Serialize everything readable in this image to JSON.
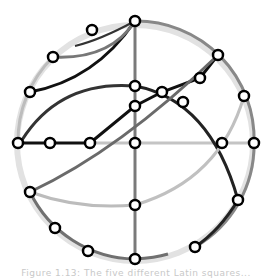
{
  "caption": "Figure 1.13: The five different Latin squares...",
  "colors": {
    "rim_outer": "#dcdcdc",
    "rim_inner": "#777777",
    "light": "#bdbdbd",
    "mid": "#6e6e6e",
    "dark": "#333333",
    "black": "#0d0d0d",
    "node_fill": "#ffffff",
    "node_stroke": "#000000"
  },
  "diagram": {
    "center": [
      135,
      143
    ],
    "radius": 118,
    "nodes": [
      {
        "id": "top",
        "x": 135,
        "y": 21
      },
      {
        "id": "bottom",
        "x": 135,
        "y": 259
      },
      {
        "id": "left",
        "x": 18,
        "y": 143
      },
      {
        "id": "right",
        "x": 254,
        "y": 143
      },
      {
        "id": "center",
        "x": 135,
        "y": 143
      },
      {
        "id": "l1",
        "x": 50,
        "y": 143
      },
      {
        "id": "l2",
        "x": 90,
        "y": 143
      },
      {
        "id": "r1",
        "x": 222,
        "y": 143
      },
      {
        "id": "u1",
        "x": 92,
        "y": 30
      },
      {
        "id": "u2",
        "x": 53,
        "y": 57
      },
      {
        "id": "u3",
        "x": 30,
        "y": 92
      },
      {
        "id": "c1",
        "x": 135,
        "y": 86
      },
      {
        "id": "c2",
        "x": 135,
        "y": 106
      },
      {
        "id": "c3",
        "x": 135,
        "y": 205
      },
      {
        "id": "x1",
        "x": 162,
        "y": 92
      },
      {
        "id": "x2",
        "x": 200,
        "y": 78
      },
      {
        "id": "x3",
        "x": 218,
        "y": 55
      },
      {
        "id": "x4",
        "x": 183,
        "y": 102
      },
      {
        "id": "rs",
        "x": 244,
        "y": 96
      },
      {
        "id": "ll1",
        "x": 30,
        "y": 192
      },
      {
        "id": "ll2",
        "x": 55,
        "y": 228
      },
      {
        "id": "ll3",
        "x": 88,
        "y": 251
      },
      {
        "id": "lr1",
        "x": 238,
        "y": 200
      },
      {
        "id": "lr2",
        "x": 195,
        "y": 247
      }
    ]
  }
}
